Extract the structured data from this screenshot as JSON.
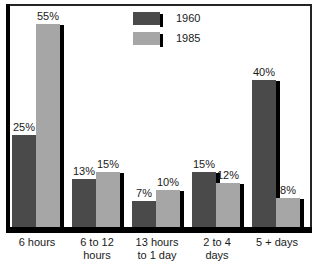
{
  "chart_data": {
    "type": "bar",
    "title": "",
    "subtitle": "",
    "xlabel": "",
    "ylabel": "",
    "ylim": [
      0,
      60
    ],
    "grid": false,
    "legend_position": "top-center",
    "categories": [
      "6 hours",
      "6 to 12\nhours",
      "13 hours\nto 1 day",
      "2 to 4\ndays",
      "5 + days"
    ],
    "series": [
      {
        "name": "1960",
        "color": "#4a4a4a",
        "values": [
          25,
          13,
          7,
          15,
          40
        ],
        "labels": [
          "25%",
          "13%",
          "7%",
          "15%",
          "40%"
        ]
      },
      {
        "name": "1985",
        "color": "#a6a6a6",
        "values": [
          55,
          15,
          10,
          12,
          8
        ],
        "labels": [
          "55%",
          "15%",
          "10%",
          "12%",
          "8%"
        ]
      }
    ]
  },
  "legend": {
    "items": [
      {
        "label": "1960",
        "color": "#4a4a4a"
      },
      {
        "label": "1985",
        "color": "#a6a6a6"
      }
    ]
  },
  "colors": {
    "series_1960": "#4a4a4a",
    "series_1985": "#a6a6a6",
    "axis": "#000000",
    "frame": "#242424",
    "background": "#ffffff",
    "text": "#1a1a1a"
  }
}
